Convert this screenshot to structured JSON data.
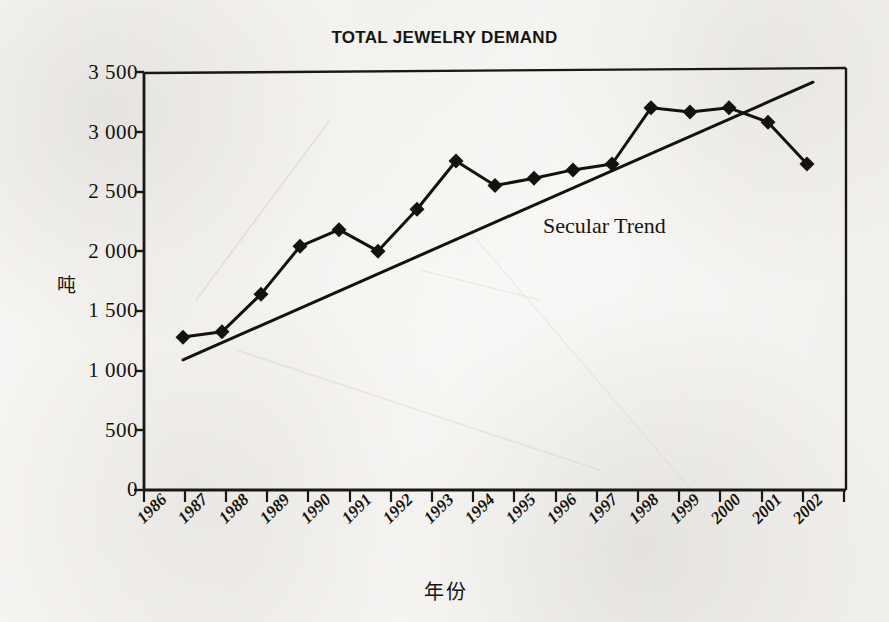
{
  "figure": {
    "title": "TOTAL JEWELRY DEMAND",
    "y_axis_label": "吨",
    "x_axis_label": "年份",
    "annotation": "Secular Trend"
  },
  "chart_data": {
    "type": "line",
    "title": "TOTAL JEWELRY DEMAND",
    "xlabel": "年份",
    "ylabel": "吨",
    "ylim": [
      0,
      3500
    ],
    "ytick_labels": [
      "3 500",
      "3 000",
      "2 500",
      "2 000",
      "1 500",
      "1 000",
      "500",
      "0"
    ],
    "ytick_values": [
      3500,
      3000,
      2500,
      2000,
      1500,
      1000,
      500,
      0
    ],
    "grid": false,
    "legend": "none",
    "categories": [
      "1986",
      "1987",
      "1988",
      "1989",
      "1990",
      "1991",
      "1992",
      "1993",
      "1994",
      "1995",
      "1996",
      "1997",
      "1998",
      "1999",
      "2000",
      "2001",
      "2002"
    ],
    "series": [
      {
        "name": "Total jewelry demand",
        "marker": "diamond",
        "values": [
          1280,
          1325,
          1640,
          2040,
          2180,
          2000,
          2350,
          2755,
          2550,
          2610,
          2680,
          2730,
          3200,
          3165,
          3200,
          3080,
          2730
        ]
      },
      {
        "name": "Secular Trend",
        "marker": "none",
        "annotation": "Secular Trend",
        "endpoints": [
          {
            "x": "1986",
            "y": 1090
          },
          {
            "x": "2002",
            "y": 3415
          }
        ]
      }
    ]
  }
}
